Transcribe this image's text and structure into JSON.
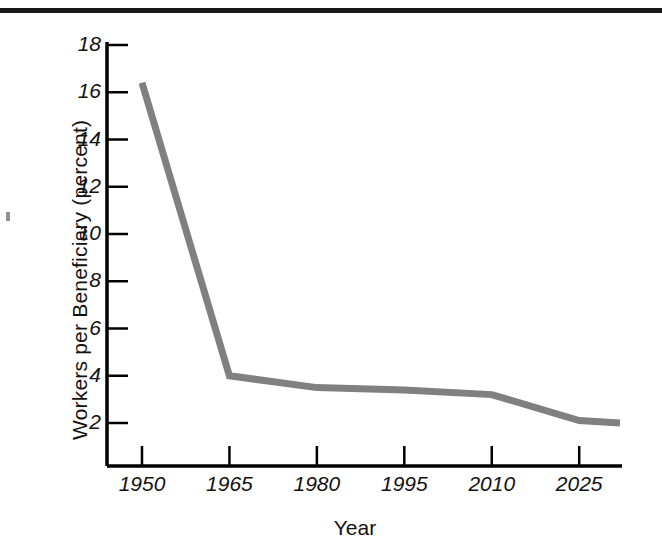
{
  "figure": {
    "background_color": "#ffffff",
    "rule_color": "#1a1a1a",
    "line_color": "#808080",
    "axis_color": "#000000"
  },
  "chart_data": {
    "type": "line",
    "title": "",
    "xlabel": "Year",
    "ylabel": "Workers per Beneficiary (percent)",
    "x": [
      1950,
      1965,
      1980,
      1995,
      2010,
      2025,
      2032
    ],
    "values": [
      16.4,
      4.0,
      3.5,
      3.4,
      3.2,
      2.1,
      2.0
    ],
    "series": [
      {
        "name": "Workers per Beneficiary",
        "values": [
          16.4,
          4.0,
          3.5,
          3.4,
          3.2,
          2.1,
          2.0
        ],
        "color": "#808080"
      }
    ],
    "xlim": [
      1950,
      2032
    ],
    "ylim": [
      1.2,
      18.8
    ],
    "xticks": [
      1950,
      1965,
      1980,
      1995,
      2010,
      2025
    ],
    "xtick_labels": [
      "1950",
      "1965",
      "1980",
      "1995",
      "2010",
      "2025"
    ],
    "yticks": [
      2,
      4,
      6,
      8,
      10,
      12,
      14,
      16,
      18
    ],
    "ytick_labels": [
      "2",
      "4",
      "6",
      "8",
      "10",
      "12",
      "14",
      "16",
      "18"
    ],
    "grid": false,
    "legend": false,
    "legend_position": "none"
  }
}
